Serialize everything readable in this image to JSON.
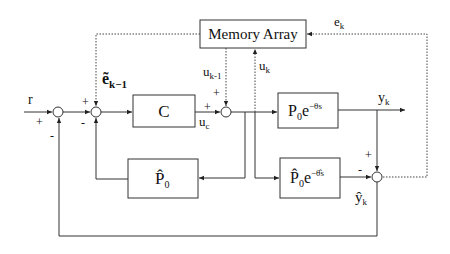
{
  "diagram": {
    "type": "block-diagram",
    "title": "",
    "blocks": {
      "memory": {
        "label": "Memory Array"
      },
      "controller": {
        "label": "C"
      },
      "plant": {
        "main": "P",
        "sub": "0",
        "rest": "e",
        "exp": "−θs"
      },
      "model_nodelay": {
        "main": "P̂",
        "sub": "0"
      },
      "model_delay": {
        "main": "P̂",
        "sub": "0",
        "rest": "e",
        "exp": "−θ̂s"
      }
    },
    "signals": {
      "r": "r",
      "e_tilde": {
        "main": "ẽ",
        "sub": "k−1"
      },
      "u_k_minus_1": {
        "main": "u",
        "sub": "k-1"
      },
      "u_k": {
        "main": "u",
        "sub": "k"
      },
      "u_c": {
        "main": "u",
        "sub": "c"
      },
      "y_k": {
        "main": "y",
        "sub": "k"
      },
      "y_hat_k": {
        "main": "ŷ",
        "sub": "k"
      },
      "e_k": {
        "main": "e",
        "sub": "k"
      }
    },
    "signs": {
      "s1_r": "+",
      "s1_fb": "-",
      "s2_top": "+",
      "s2_left": "+",
      "s2_bottom": "-",
      "s3_top": "+",
      "s3_left": "+",
      "s4_top": "+",
      "s4_left": "-"
    }
  }
}
